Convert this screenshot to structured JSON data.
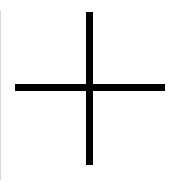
{
  "icon": {
    "name": "plus-icon",
    "color": "#000000",
    "background": "#ffffff"
  }
}
